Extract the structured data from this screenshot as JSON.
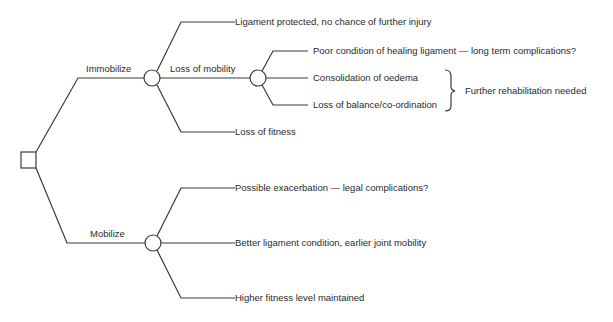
{
  "diagram": {
    "type": "decision-tree",
    "line_color": "#3a3a3a",
    "decision_node": {
      "shape": "square"
    },
    "branches": {
      "immobilize": {
        "label": "Immobilize",
        "outcomes": {
          "ligament_protected": "Ligament protected, no chance of further injury",
          "loss_of_mobility": "Loss of mobility",
          "loss_of_fitness": "Loss of fitness"
        },
        "loss_of_mobility_outcomes": {
          "poor_condition": "Poor condition of healing ligament — long term complications?",
          "consolidation": "Consolidation of oedema",
          "loss_of_balance": "Loss of balance/co-ordination"
        },
        "bracket_note": "Further rehabilitation needed"
      },
      "mobilize": {
        "label": "Mobilize",
        "outcomes": {
          "exacerbation": "Possible exacerbation — legal complications?",
          "better_ligament": "Better ligament condition, earlier joint mobility",
          "higher_fitness": "Higher fitness level maintained"
        }
      }
    }
  }
}
